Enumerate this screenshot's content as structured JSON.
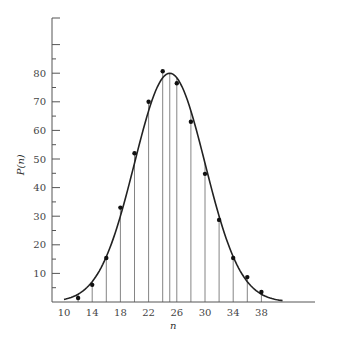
{
  "chart_data": {
    "type": "scatter",
    "title": "",
    "xlabel": "n",
    "ylabel": "P(n)",
    "xlim": [
      8.5,
      46
    ],
    "ylim": [
      0,
      99
    ],
    "grid": false,
    "legend": "none",
    "x_ticks": [
      10,
      14,
      18,
      22,
      26,
      30,
      34,
      38
    ],
    "x_tick_labels": [
      "10",
      "14",
      "18",
      "22",
      "26",
      "30",
      "34",
      "38"
    ],
    "y_major_ticks": [
      10,
      20,
      30,
      40,
      50,
      60,
      70,
      80,
      90
    ],
    "y_tick_labels": [
      "10",
      "20",
      "30",
      "40",
      "50",
      "60",
      "70",
      "80",
      ""
    ],
    "y_minor_ticks": [
      5,
      15,
      25,
      35,
      45,
      55,
      65,
      75,
      85
    ],
    "series": [
      {
        "name": "measured",
        "kind": "points-with-stems",
        "x": [
          12,
          14,
          16,
          18,
          20,
          22,
          24,
          26,
          28,
          30,
          32,
          34,
          36,
          38
        ],
        "y": [
          1.4,
          6,
          15.4,
          33,
          52,
          70,
          80.7,
          76.5,
          63,
          44.8,
          28.7,
          15.4,
          8.7,
          3.5
        ]
      },
      {
        "name": "gaussian fit",
        "kind": "curve",
        "mean": 25,
        "peak": 80,
        "sigma": 5,
        "x_range": [
          10,
          41
        ]
      }
    ],
    "peak_marker": {
      "x": 25,
      "y": 80
    }
  }
}
